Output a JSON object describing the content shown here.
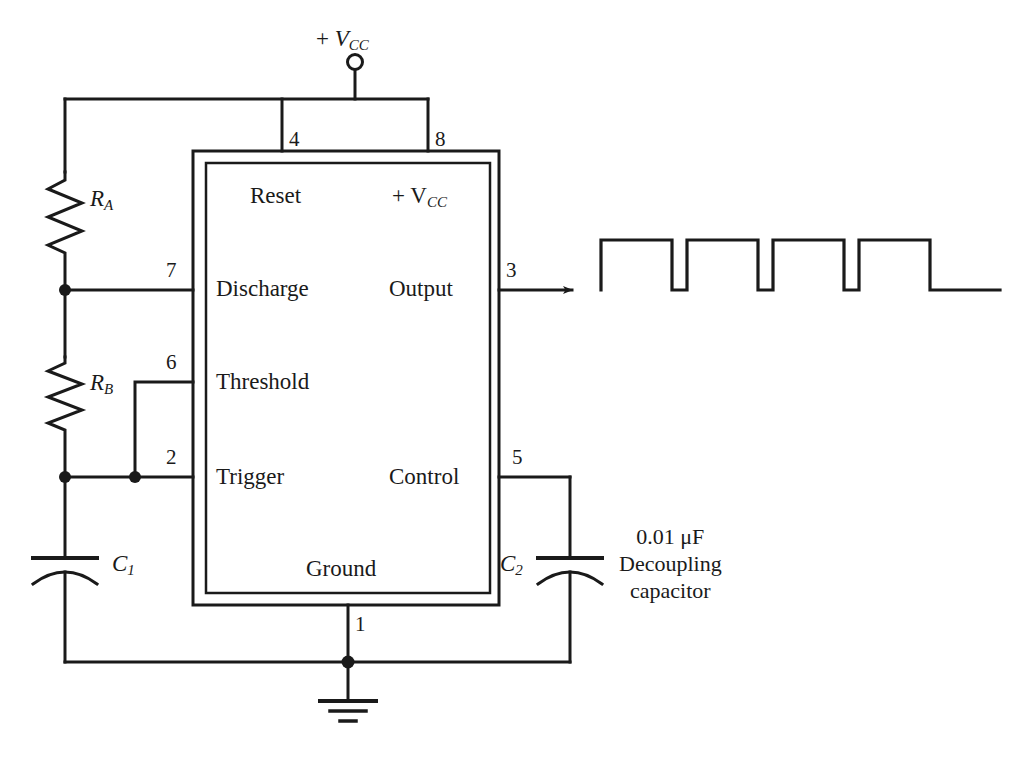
{
  "diagram": {
    "ic": {
      "name": "555-timer-ic",
      "pin_functions": {
        "reset": "Reset",
        "vcc": "+ V",
        "vcc_sub": "CC",
        "discharge": "Discharge",
        "output": "Output",
        "threshold": "Threshold",
        "trigger": "Trigger",
        "control": "Control",
        "ground": "Ground"
      },
      "pin_numbers": {
        "reset": "4",
        "vcc": "8",
        "discharge": "7",
        "output": "3",
        "threshold": "6",
        "trigger": "2",
        "control": "5",
        "ground": "1"
      }
    },
    "supply": {
      "plus": "+",
      "symbol": "V",
      "subscript": "CC"
    },
    "components": {
      "ra": {
        "symbol": "R",
        "subscript": "A"
      },
      "rb": {
        "symbol": "R",
        "subscript": "B"
      },
      "c1": {
        "symbol": "C",
        "subscript": "1"
      },
      "c2": {
        "symbol": "C",
        "subscript": "2"
      }
    },
    "annotation": {
      "value": "0.01 μF",
      "line2": "Decoupling",
      "line3": "capacitor"
    },
    "colors": {
      "line": "#1a1a1a",
      "background": "#ffffff",
      "text": "#1a1a1a"
    },
    "waveform": {
      "type": "square-wave",
      "pulses": 4,
      "high_y": 240,
      "low_y": 290
    }
  }
}
